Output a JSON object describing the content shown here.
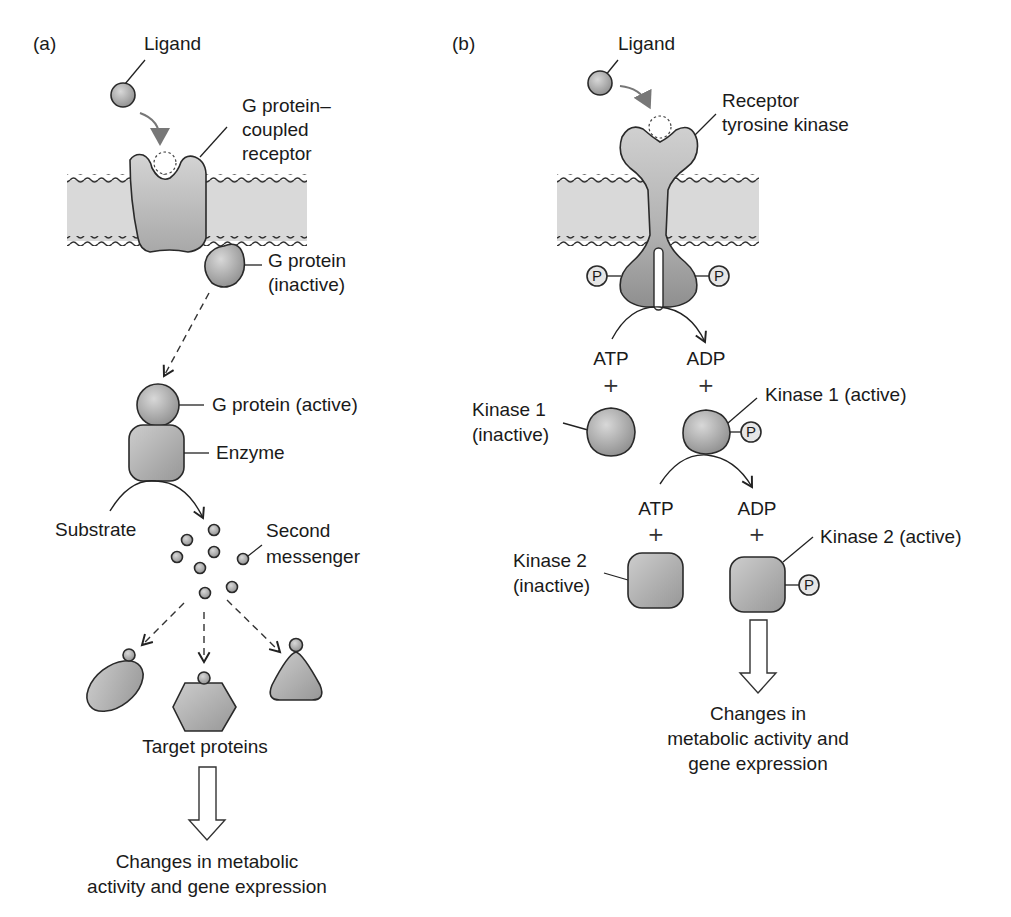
{
  "figure": {
    "panel_a": {
      "label": "(a)",
      "ligand": "Ligand",
      "receptor_line1": "G protein–",
      "receptor_line2": "coupled",
      "receptor_line3": "receptor",
      "g_inactive_line1": "G protein",
      "g_inactive_line2": "(inactive)",
      "g_active": "G protein (active)",
      "enzyme": "Enzyme",
      "substrate": "Substrate",
      "second_messenger_line1": "Second",
      "second_messenger_line2": "messenger",
      "target_proteins": "Target proteins",
      "outcome_line1": "Changes in metabolic",
      "outcome_line2": "activity and gene expression"
    },
    "panel_b": {
      "label": "(b)",
      "ligand": "Ligand",
      "receptor_line1": "Receptor",
      "receptor_line2": "tyrosine kinase",
      "phosphate": "P",
      "atp_1": "ATP",
      "adp_1": "ADP",
      "plus": "+",
      "kinase1_inactive_line1": "Kinase 1",
      "kinase1_inactive_line2": "(inactive)",
      "kinase1_active": "Kinase 1 (active)",
      "atp_2": "ATP",
      "adp_2": "ADP",
      "kinase2_inactive_line1": "Kinase 2",
      "kinase2_inactive_line2": "(inactive)",
      "kinase2_active": "Kinase 2 (active)",
      "outcome_line1": "Changes in",
      "outcome_line2": "metabolic activity and",
      "outcome_line3": "gene expression"
    },
    "colors": {
      "membrane": "#d9d9d9",
      "protein_light": "#cfcfcf",
      "protein_dark": "#9a9a9a",
      "outline": "#2a2a2a",
      "ligand_arrow": "#7a7a7a"
    }
  }
}
